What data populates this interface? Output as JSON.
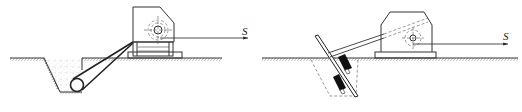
{
  "diagram": {
    "type": "engineering-line-drawing",
    "panels": [
      {
        "id": "left",
        "description": "Winch on skid base anchored by cable to buried log deadman in trench",
        "force_label": "S",
        "components": [
          "winch-housing",
          "drum",
          "skid-base",
          "anchor-cable",
          "buried-log",
          "trench",
          "ground-line"
        ]
      },
      {
        "id": "right",
        "description": "Winch on base plate anchored by strut to inclined plate anchor driven into ground",
        "force_label": "S",
        "components": [
          "winch-housing",
          "drum",
          "base-plate",
          "strut",
          "inclined-plate",
          "anchor-blocks",
          "ground-line"
        ]
      }
    ],
    "colors": {
      "line": "#333333",
      "fill_dark": "#111111",
      "background": "#ffffff"
    }
  }
}
